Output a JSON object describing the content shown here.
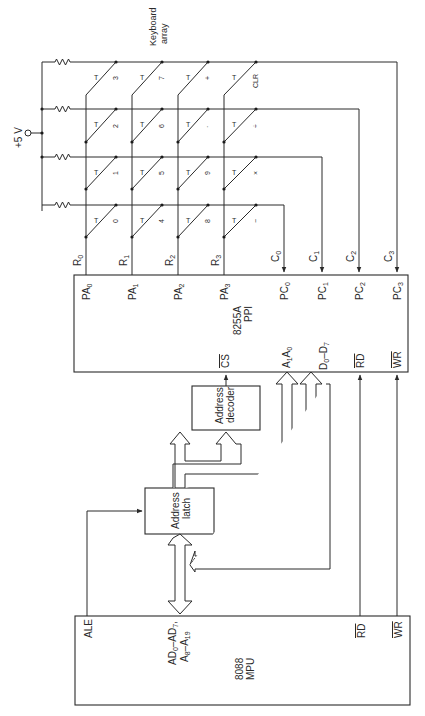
{
  "diagram": {
    "orientation": "rotated-90-ccw",
    "supply": {
      "label": "+5 V"
    },
    "keyboard": {
      "label_line1": "Keyboard",
      "label_line2": "array",
      "switch_symbol": "T",
      "rows": [
        {
          "name": "R",
          "sub": "0",
          "keys": [
            "0",
            "1",
            "2",
            "3"
          ]
        },
        {
          "name": "R",
          "sub": "1",
          "keys": [
            "4",
            "5",
            "6",
            "7"
          ]
        },
        {
          "name": "R",
          "sub": "2",
          "keys": [
            "8",
            "9",
            "·",
            "+"
          ]
        },
        {
          "name": "R",
          "sub": "3",
          "keys": [
            "−",
            "×",
            "÷",
            "CLR"
          ]
        }
      ],
      "columns": [
        {
          "name": "C",
          "sub": "0"
        },
        {
          "name": "C",
          "sub": "1"
        },
        {
          "name": "C",
          "sub": "2"
        },
        {
          "name": "C",
          "sub": "3"
        }
      ]
    },
    "ppi": {
      "title_line1": "8255A",
      "title_line2": "PPI",
      "port_a_pins": [
        {
          "name": "PA",
          "sub": "0"
        },
        {
          "name": "PA",
          "sub": "1"
        },
        {
          "name": "PA",
          "sub": "2"
        },
        {
          "name": "PA",
          "sub": "3"
        }
      ],
      "port_c_pins": [
        {
          "name": "PC",
          "sub": "0"
        },
        {
          "name": "PC",
          "sub": "1"
        },
        {
          "name": "PC",
          "sub": "2"
        },
        {
          "name": "PC",
          "sub": "3"
        }
      ],
      "cs_pin": "CS",
      "addr_pins": {
        "a": "A",
        "a_sub": "1",
        "b": "A",
        "b_sub": "0"
      },
      "data_pins": {
        "a": "D",
        "a_sub": "0",
        "sep": "–",
        "b": "D",
        "b_sub": "7"
      },
      "rd_pin": "RD",
      "wr_pin": "WR"
    },
    "address_decoder": {
      "line1": "Address",
      "line2": "decoder"
    },
    "address_latch": {
      "line1": "Address",
      "line2": "latch"
    },
    "mpu": {
      "title_line1": "8088",
      "title_line2": "MPU",
      "ale_pin": "ALE",
      "bus_pin_line1": {
        "a": "AD",
        "a_sub": "0",
        "sep": "–",
        "b": "AD",
        "b_sub": "7",
        "tail": ","
      },
      "bus_pin_line2": {
        "a": "A",
        "a_sub": "8",
        "sep": "–",
        "b": "A",
        "b_sub": "19"
      },
      "rd_pin": "RD",
      "wr_pin": "WR"
    }
  }
}
